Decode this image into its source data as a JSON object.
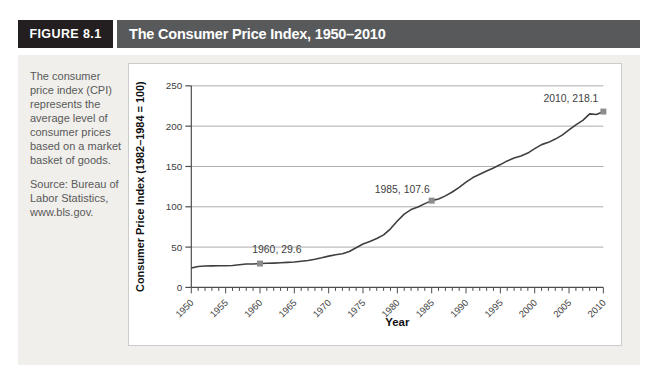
{
  "figure": {
    "label": "FIGURE 8.1",
    "title": "The Consumer Price Index, 1950–2010"
  },
  "sidebar": {
    "description": "The consumer price index (CPI) represents the average level of consumer prices based on a market basket of goods.",
    "source": "Source: Bureau of Labor Statistics, www.bls.gov."
  },
  "chart_data": {
    "type": "line",
    "title": "The Consumer Price Index, 1950–2010",
    "xlabel": "Year",
    "ylabel": "Consumer Price Index (1982–1984 = 100)",
    "xlim": [
      1950,
      2010
    ],
    "ylim": [
      0,
      250
    ],
    "x_major_ticks": [
      1950,
      1955,
      1960,
      1965,
      1970,
      1975,
      1980,
      1985,
      1990,
      1995,
      2000,
      2005,
      2010
    ],
    "x_minor_tick_interval": 1,
    "y_ticks": [
      0,
      50,
      100,
      150,
      200,
      250
    ],
    "grid": "horizontal",
    "legend": "none",
    "x": [
      1950,
      1951,
      1952,
      1953,
      1954,
      1955,
      1956,
      1957,
      1958,
      1959,
      1960,
      1961,
      1962,
      1963,
      1964,
      1965,
      1966,
      1967,
      1968,
      1969,
      1970,
      1971,
      1972,
      1973,
      1974,
      1975,
      1976,
      1977,
      1978,
      1979,
      1980,
      1981,
      1982,
      1983,
      1984,
      1985,
      1986,
      1987,
      1988,
      1989,
      1990,
      1991,
      1992,
      1993,
      1994,
      1995,
      1996,
      1997,
      1998,
      1999,
      2000,
      2001,
      2002,
      2003,
      2004,
      2005,
      2006,
      2007,
      2008,
      2009,
      2010
    ],
    "values": [
      24.1,
      26.0,
      26.5,
      26.7,
      26.9,
      26.8,
      27.2,
      28.1,
      28.9,
      29.1,
      29.6,
      29.9,
      30.2,
      30.6,
      31.0,
      31.5,
      32.4,
      33.4,
      34.8,
      36.7,
      38.8,
      40.5,
      41.8,
      44.4,
      49.3,
      53.8,
      56.9,
      60.6,
      65.2,
      72.6,
      82.4,
      90.9,
      96.5,
      99.6,
      103.9,
      107.6,
      109.6,
      113.6,
      118.3,
      124.0,
      130.7,
      136.2,
      140.3,
      144.5,
      148.2,
      152.4,
      156.9,
      160.5,
      163.0,
      166.6,
      172.2,
      177.1,
      179.9,
      184.0,
      188.9,
      195.3,
      201.6,
      207.3,
      215.3,
      214.5,
      218.1
    ],
    "annotations": [
      {
        "year": 1960,
        "value": 29.6,
        "label": "1960, 29.6",
        "anchor": "middle",
        "dx": 17,
        "dy": -11
      },
      {
        "year": 1985,
        "value": 107.6,
        "label": "1985, 107.6",
        "anchor": "end",
        "dx": -2,
        "dy": -8
      },
      {
        "year": 2010,
        "value": 218.1,
        "label": "2010, 218.1",
        "anchor": "end",
        "dx": -5,
        "dy": -10
      }
    ]
  },
  "colors": {
    "figure_label_bg": "#231f20",
    "title_bar_bg": "#58595b",
    "header_text": "#ffffff",
    "panel_bg": "#f0efeb",
    "chart_bg": "#ffffff",
    "chart_border": "#cccccc",
    "line": "#3f3f3f",
    "marker": "#8c8c8c",
    "grid": "#ababab",
    "axis": "#4d4d4d",
    "tick_text": "#404040",
    "axis_title_text": "#111111"
  }
}
